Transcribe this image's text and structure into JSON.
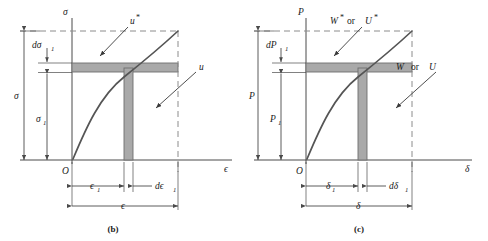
{
  "figure": {
    "panels": [
      {
        "id": "b",
        "caption": "(b)",
        "axes": {
          "y_label": "σ",
          "x_label": "ϵ",
          "origin_label": "O"
        },
        "region_labels": {
          "upper": "u*",
          "upper_plain": "u",
          "upper_star": "*",
          "lower": "u"
        },
        "dimensions": {
          "y_total": "σ",
          "y_inner": "σ₁",
          "y_inner_base": "σ",
          "y_inner_sub": "1",
          "y_increment": "dσ₁",
          "y_increment_base": "dσ",
          "y_increment_sub": "1",
          "x_inner": "ϵ₁",
          "x_inner_base": "ϵ",
          "x_inner_sub": "1",
          "x_increment": "dϵ₁",
          "x_increment_base": "dϵ",
          "x_increment_sub": "1",
          "x_total": "ϵ"
        }
      },
      {
        "id": "c",
        "caption": "(c)",
        "axes": {
          "y_label": "P",
          "x_label": "δ",
          "origin_label": "O"
        },
        "region_labels": {
          "upper_first": "W",
          "upper_conj": "or",
          "upper_second": "U",
          "upper_star": "*",
          "lower_first": "W",
          "lower_conj": "or",
          "lower_second": "U"
        },
        "dimensions": {
          "y_total": "P",
          "y_inner_base": "P",
          "y_inner_sub": "1",
          "y_increment_base": "dP",
          "y_increment_sub": "1",
          "x_inner_base": "δ",
          "x_inner_sub": "1",
          "x_increment_base": "dδ",
          "x_increment_sub": "1",
          "x_total": "δ"
        }
      }
    ],
    "colors": {
      "line": "#4a4a4a",
      "curve": "#555555",
      "shade_fill": "#a9a9a9",
      "shade_stroke": "#6e6e6e",
      "dash": "#8c8c8c",
      "text": "#1a1a1a",
      "background": "#ffffff"
    },
    "geometry": {
      "note": "Concave-down nonlinear curve from origin to upper-right endpoint; horizontal gray band of height d-sigma-1 and vertical gray band of width d-epsilon-1 meet on the curve",
      "curve_start": [
        0,
        0
      ],
      "curve_point_1": [
        0.62,
        0.66
      ],
      "curve_end": [
        1.0,
        1.0
      ]
    }
  }
}
